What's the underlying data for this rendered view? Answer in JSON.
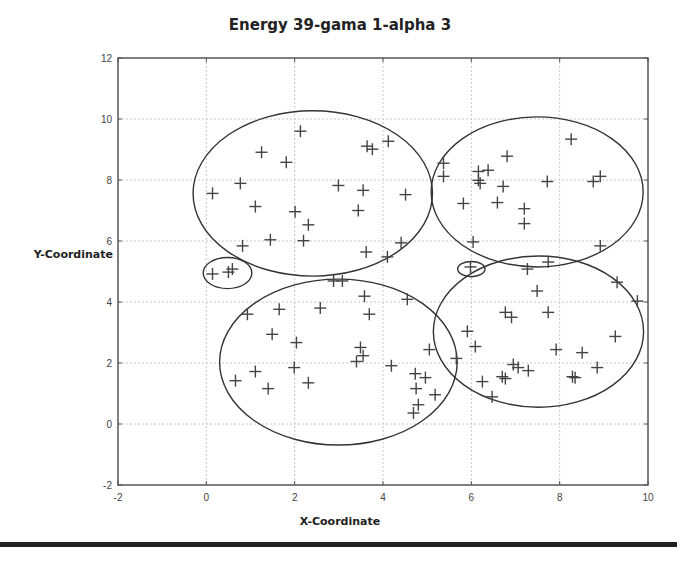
{
  "chart_data": {
    "type": "scatter",
    "title": "Energy 39-gama 1-alpha 3",
    "xlabel": "X-Coordinate",
    "ylabel": "Y-Coordinate",
    "xlim": [
      -2,
      10
    ],
    "ylim": [
      -2,
      12
    ],
    "xticks": [
      -2,
      0,
      2,
      4,
      6,
      8,
      10
    ],
    "yticks": [
      -2,
      0,
      2,
      4,
      6,
      8,
      10,
      12
    ],
    "grid": true,
    "marker": "+",
    "points": [
      [
        2.13,
        9.6
      ],
      [
        1.25,
        8.91
      ],
      [
        1.81,
        8.58
      ],
      [
        3.64,
        9.11
      ],
      [
        3.76,
        9.01
      ],
      [
        4.12,
        9.27
      ],
      [
        0.77,
        7.89
      ],
      [
        0.14,
        7.56
      ],
      [
        2.99,
        7.82
      ],
      [
        3.55,
        7.66
      ],
      [
        4.51,
        7.52
      ],
      [
        1.11,
        7.13
      ],
      [
        2.01,
        6.96
      ],
      [
        3.44,
        7.0
      ],
      [
        2.31,
        6.53
      ],
      [
        1.45,
        6.04
      ],
      [
        2.2,
        6.01
      ],
      [
        0.82,
        5.84
      ],
      [
        4.41,
        5.94
      ],
      [
        3.62,
        5.64
      ],
      [
        4.1,
        5.48
      ],
      [
        8.26,
        9.34
      ],
      [
        6.81,
        8.78
      ],
      [
        5.37,
        8.55
      ],
      [
        5.37,
        8.12
      ],
      [
        6.16,
        8.28
      ],
      [
        6.38,
        8.32
      ],
      [
        6.16,
        7.99
      ],
      [
        6.2,
        7.89
      ],
      [
        6.72,
        7.79
      ],
      [
        7.72,
        7.95
      ],
      [
        8.76,
        7.95
      ],
      [
        8.92,
        8.12
      ],
      [
        5.82,
        7.23
      ],
      [
        6.59,
        7.26
      ],
      [
        7.2,
        7.06
      ],
      [
        7.2,
        6.57
      ],
      [
        6.04,
        5.97
      ],
      [
        8.92,
        5.84
      ],
      [
        0.14,
        4.92
      ],
      [
        0.5,
        4.98
      ],
      [
        0.59,
        5.08
      ],
      [
        5.98,
        5.15
      ],
      [
        2.88,
        4.69
      ],
      [
        3.08,
        4.69
      ],
      [
        3.58,
        4.19
      ],
      [
        0.93,
        3.6
      ],
      [
        1.65,
        3.76
      ],
      [
        2.58,
        3.8
      ],
      [
        3.69,
        3.6
      ],
      [
        4.55,
        4.09
      ],
      [
        1.49,
        2.94
      ],
      [
        2.04,
        2.67
      ],
      [
        3.49,
        2.51
      ],
      [
        3.55,
        2.24
      ],
      [
        3.4,
        2.05
      ],
      [
        5.05,
        2.44
      ],
      [
        1.11,
        1.72
      ],
      [
        1.99,
        1.85
      ],
      [
        0.66,
        1.42
      ],
      [
        1.4,
        1.16
      ],
      [
        2.31,
        1.35
      ],
      [
        4.19,
        1.91
      ],
      [
        4.73,
        1.65
      ],
      [
        4.96,
        1.52
      ],
      [
        4.75,
        1.16
      ],
      [
        5.18,
        0.96
      ],
      [
        4.8,
        0.63
      ],
      [
        4.69,
        0.36
      ],
      [
        7.27,
        5.08
      ],
      [
        7.74,
        5.31
      ],
      [
        9.3,
        4.65
      ],
      [
        9.76,
        4.03
      ],
      [
        7.49,
        4.36
      ],
      [
        6.77,
        3.66
      ],
      [
        6.91,
        3.5
      ],
      [
        7.74,
        3.66
      ],
      [
        5.91,
        3.04
      ],
      [
        6.09,
        2.54
      ],
      [
        9.26,
        2.87
      ],
      [
        7.92,
        2.44
      ],
      [
        8.51,
        2.34
      ],
      [
        5.66,
        2.15
      ],
      [
        6.95,
        1.95
      ],
      [
        7.06,
        1.85
      ],
      [
        7.29,
        1.75
      ],
      [
        8.85,
        1.85
      ],
      [
        6.25,
        1.39
      ],
      [
        6.7,
        1.55
      ],
      [
        6.77,
        1.49
      ],
      [
        8.29,
        1.55
      ],
      [
        8.35,
        1.52
      ],
      [
        6.47,
        0.89
      ]
    ],
    "clusters": [
      {
        "name": "top-left",
        "cx": 2.41,
        "cy": 7.56,
        "rx": 2.71,
        "ry": 2.71
      },
      {
        "name": "top-right",
        "cx": 7.49,
        "cy": 7.61,
        "rx": 2.4,
        "ry": 2.46
      },
      {
        "name": "bottom-left",
        "cx": 2.99,
        "cy": 2.03,
        "rx": 2.69,
        "ry": 2.72
      },
      {
        "name": "bottom-right",
        "cx": 7.52,
        "cy": 3.03,
        "rx": 2.38,
        "ry": 2.48
      },
      {
        "name": "small-left",
        "cx": 0.48,
        "cy": 4.95,
        "rx": 0.55,
        "ry": 0.51
      },
      {
        "name": "small-right",
        "cx": 6.0,
        "cy": 5.08,
        "rx": 0.31,
        "ry": 0.25
      }
    ]
  }
}
